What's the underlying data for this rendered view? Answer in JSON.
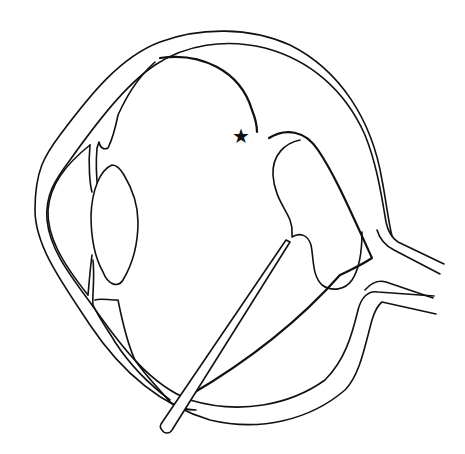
{
  "figure": {
    "marker_symbol": "★",
    "line_color": "#111111",
    "background_color": "#ffffff",
    "structures": [
      "sclera-outer",
      "sclera-inner",
      "cornea",
      "iris",
      "lens",
      "ciliary-body",
      "detached-retina",
      "retinal-break",
      "subretinal-fluid-region",
      "optic-nerve",
      "instrument-probe"
    ]
  }
}
